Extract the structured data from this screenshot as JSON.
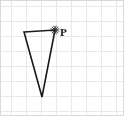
{
  "figure": {
    "canvas": {
      "width": 124,
      "height": 116
    },
    "background_color": "#ffffff"
  },
  "grid": {
    "name": "graph-paper-grid",
    "line_color": "#e8e8ec",
    "major_line_color": "#dedee4",
    "cell_size": 15,
    "origin_x": 11,
    "origin_y": 6,
    "vertical_lines": [
      11,
      26,
      41,
      56,
      71,
      86,
      101,
      116
    ],
    "horizontal_lines": [
      6,
      21,
      36,
      51,
      66,
      81,
      96,
      111
    ],
    "border_color": "#d8d8de"
  },
  "shape": {
    "name": "triangle",
    "type": "polygon",
    "stroke_color": "#1a1a1a",
    "stroke_width": 1.6,
    "fill": "none",
    "vertices": [
      {
        "id": "A",
        "label": "",
        "x": 24,
        "y": 32
      },
      {
        "id": "P",
        "label": "P",
        "x": 55,
        "y": 30
      },
      {
        "id": "B",
        "label": "",
        "x": 42,
        "y": 97
      }
    ]
  },
  "markers": [
    {
      "name": "point-p-star-marker",
      "glyph": "star",
      "x": 55,
      "y": 30,
      "size": 9,
      "color": "#2b2b2b"
    }
  ],
  "labels": [
    {
      "name": "vertex-label-p",
      "text": "P",
      "x": 60,
      "y": 27,
      "color": "#1a1a1a",
      "font_size": 11,
      "bold": true
    }
  ]
}
